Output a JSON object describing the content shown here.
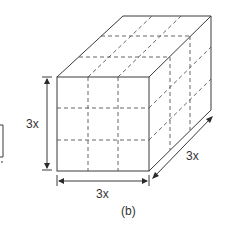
{
  "figure": {
    "caption": "(b)",
    "shape": "cube divided into 3x3x3 smaller cubes",
    "dimensions": {
      "height_label": "3x",
      "width_label": "3x",
      "depth_label": "3x"
    },
    "partial_left_figure": "(a) cut off at left edge"
  },
  "colors": {
    "line": "#3a3a3a",
    "background": "#ffffff"
  }
}
